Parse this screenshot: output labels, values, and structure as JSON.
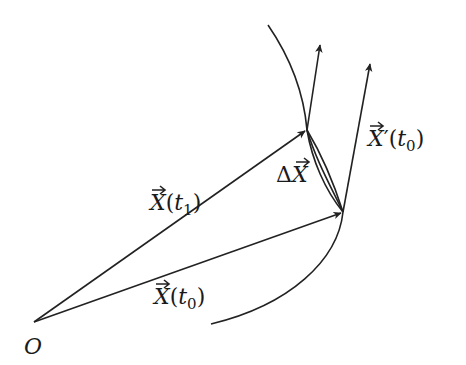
{
  "figure": {
    "type": "vector-derivative-diagram",
    "colors": {
      "stroke": "#222222",
      "text": "#1a1a1a",
      "background": "#ffffff"
    },
    "origin": {
      "label": "O",
      "x": 34,
      "y": 322
    },
    "curve": {
      "path": "M 268 25 Q 300 75 307 130 Q 322 175 343 212 Q 330 290 211 324"
    },
    "vectors": [
      {
        "name": "X(t1)",
        "from": [
          34,
          322
        ],
        "to": [
          307,
          130
        ]
      },
      {
        "name": "X(t0)",
        "from": [
          34,
          322
        ],
        "to": [
          343,
          212
        ]
      },
      {
        "name": "tangent-at-t1",
        "from": [
          307,
          130
        ],
        "to": [
          320,
          43
        ]
      },
      {
        "name": "X'(t0)",
        "from": [
          343,
          212
        ],
        "to": [
          370,
          62
        ]
      }
    ],
    "chord": {
      "name": "delta-X",
      "from": [
        307,
        130
      ],
      "to": [
        343,
        212
      ]
    },
    "labels": {
      "origin": "O",
      "x_t1": {
        "vec": "X",
        "open": "(",
        "var": "t",
        "sub": "1",
        "close": ")"
      },
      "x_t0": {
        "vec": "X",
        "open": "(",
        "var": "t",
        "sub": "0",
        "close": ")"
      },
      "delta": {
        "prefix": "Δ",
        "vec": "X"
      },
      "deriv": {
        "vec": "X",
        "prime": "′",
        "open": "(",
        "var": "t",
        "sub": "0",
        "close": ")"
      }
    }
  }
}
